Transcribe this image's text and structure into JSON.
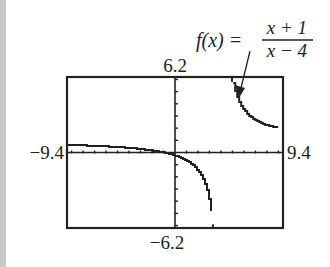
{
  "chart_data": {
    "type": "line",
    "title": "",
    "function_label": {
      "lhs": "f(x) =",
      "numerator": "x + 1",
      "denominator": "x − 4"
    },
    "expression": "(x+1)/(x-4)",
    "xlim": [
      -9.4,
      9.4
    ],
    "ylim": [
      -6.2,
      6.2
    ],
    "x_tick_step": 1,
    "y_tick_step": 1,
    "window_labels": {
      "xmin": "−9.4",
      "xmax": "9.4",
      "ymin": "−6.2",
      "ymax": "6.2"
    },
    "vertical_asymptote": 4,
    "horizontal_asymptote": 1,
    "grid": false,
    "legend": null,
    "series": [
      {
        "name": "f(x) = (x+1)/(x-4)",
        "branch_left": {
          "x": [
            -9.4,
            -8,
            -6,
            -4,
            -2,
            -1,
            0,
            1,
            2,
            3,
            3.3
          ],
          "y": [
            0.63,
            0.58,
            0.5,
            0.38,
            0.17,
            0,
            -0.25,
            -0.67,
            -1.5,
            -4,
            -6.14
          ]
        },
        "branch_right": {
          "x": [
            4.96,
            5,
            5.5,
            6,
            7,
            8,
            9
          ],
          "y": [
            6.2,
            6,
            4.33,
            3.5,
            2.67,
            2.25,
            2
          ]
        }
      }
    ]
  },
  "colors": {
    "frame": "#222222",
    "curve": "#222222",
    "strip": "#c9c9c9",
    "background": "#ffffff"
  }
}
